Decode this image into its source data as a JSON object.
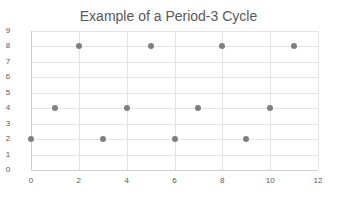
{
  "chart_data": {
    "type": "scatter",
    "title": "Example of a Period-3 Cycle",
    "xlabel": "",
    "ylabel": "",
    "x": [
      0,
      1,
      2,
      3,
      4,
      5,
      6,
      7,
      8,
      9,
      10,
      11
    ],
    "series": [
      {
        "name": "Series1",
        "values": [
          2,
          4,
          8,
          2,
          4,
          8,
          2,
          4,
          8,
          2,
          4,
          8
        ],
        "color": "#7f7f7f"
      }
    ],
    "xlim": [
      0,
      12
    ],
    "ylim": [
      0,
      9
    ],
    "xticks": [
      "0",
      "2",
      "4",
      "6",
      "8",
      "10",
      "12"
    ],
    "yticks": [
      "0",
      "1",
      "2",
      "3",
      "4",
      "5",
      "6",
      "7",
      "8",
      "9"
    ],
    "grid": true,
    "legend": "none"
  }
}
